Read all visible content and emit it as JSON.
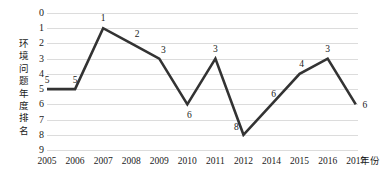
{
  "chart_data": {
    "type": "line",
    "title": "",
    "xlabel": "年份",
    "ylabel": "环境问题年度排名",
    "categories": [
      "2005",
      "2006",
      "2007",
      "2008",
      "2009",
      "2010",
      "2011",
      "2012",
      "2014",
      "2015",
      "2016",
      "2017"
    ],
    "values": [
      5,
      5,
      1,
      2,
      3,
      6,
      3,
      8,
      6,
      4,
      3,
      6
    ],
    "data_labels": [
      "5",
      "5",
      "1",
      "2",
      "3",
      "6",
      "3",
      "8",
      "6",
      "4",
      "3",
      "6"
    ],
    "ylim": [
      0,
      9
    ],
    "y_inverted": true,
    "y_ticks": [
      "0",
      "1",
      "2",
      "3",
      "4",
      "5",
      "6",
      "7",
      "8",
      "9"
    ],
    "grid": true,
    "grid_axis": "y",
    "legend": "none",
    "series": [
      {
        "name": "环境问题年度排名",
        "values": [
          5,
          5,
          1,
          2,
          3,
          6,
          3,
          8,
          6,
          4,
          3,
          6
        ],
        "color": "#333333"
      }
    ],
    "colors": {
      "line": "#333333",
      "gridline": "#dcdcdc",
      "text": "#1a1a1a",
      "background": "#ffffff"
    }
  }
}
